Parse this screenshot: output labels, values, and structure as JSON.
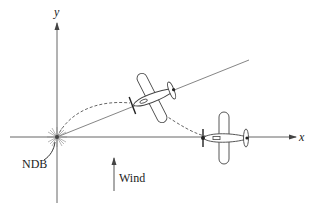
{
  "diagram": {
    "labels": {
      "y_axis": "y",
      "x_axis": "x",
      "beacon": "NDB",
      "wind": "Wind"
    },
    "colors": {
      "line": "#555555",
      "text": "#222222",
      "background": "#ffffff"
    },
    "elements": [
      "x-axis",
      "y-axis",
      "direct-course-line",
      "curved-flight-path",
      "airplane-on-course-line",
      "airplane-on-x-axis",
      "ndb-beacon",
      "wind-arrow"
    ]
  }
}
